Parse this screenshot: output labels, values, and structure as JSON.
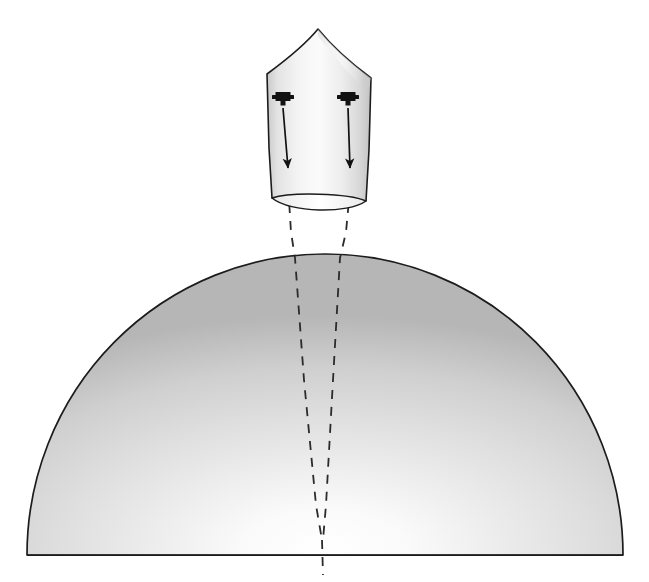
{
  "figure": {
    "domain": "Diagram",
    "title": "",
    "background_color": "#ffffff",
    "width": 649,
    "height": 582,
    "stroke_color": "#1a1a1a",
    "dash_color": "#2b2b2b"
  },
  "spacecraft": {
    "name": "capsule",
    "label": "",
    "body_fill_light": "#fcfcfc",
    "body_fill_mid": "#e8e8e8",
    "body_fill_edge": "#c9c9c9",
    "outline_color": "#1c1c1c",
    "outline_width": 1.6,
    "nose_apex": {
      "x": 318,
      "y": 29
    },
    "shoulder_left": {
      "x": 267,
      "y": 73
    },
    "shoulder_right": {
      "x": 371,
      "y": 77
    },
    "skirt_left": {
      "x": 272,
      "y": 198
    },
    "skirt_right": {
      "x": 366,
      "y": 201
    },
    "base_ellipse": {
      "cx": 319,
      "cy": 203,
      "rx": 47,
      "ry": 8
    }
  },
  "emitters": [
    {
      "name": "emitter-left",
      "label": "",
      "fill": "#111111",
      "x": 283,
      "y": 99,
      "head_width": 15,
      "head_height": 9,
      "stem_width": 5,
      "stem_height": 5
    },
    {
      "name": "emitter-right",
      "label": "",
      "fill": "#111111",
      "x": 348,
      "y": 99,
      "head_width": 15,
      "head_height": 9,
      "stem_width": 5,
      "stem_height": 5
    }
  ],
  "beam_arrows": [
    {
      "name": "beam-arrow-left",
      "label": "",
      "from": {
        "x": 283,
        "y": 108
      },
      "to": {
        "x": 288,
        "y": 168
      },
      "color": "#111111",
      "line_width": 1.7,
      "head_length": 15,
      "head_width": 9
    },
    {
      "name": "beam-arrow-right",
      "label": "",
      "from": {
        "x": 348,
        "y": 108
      },
      "to": {
        "x": 350,
        "y": 168
      },
      "color": "#111111",
      "line_width": 1.7,
      "head_length": 15,
      "head_width": 9
    }
  ],
  "sight_lines": [
    {
      "name": "sight-line-left",
      "label": "",
      "points": [
        {
          "x": 288,
          "y": 170
        },
        {
          "x": 289,
          "y": 200
        },
        {
          "x": 291,
          "y": 232
        },
        {
          "x": 295,
          "y": 258
        },
        {
          "x": 304,
          "y": 380
        },
        {
          "x": 316,
          "y": 505
        },
        {
          "x": 322,
          "y": 540
        }
      ],
      "dash": "9 8",
      "width": 1.8
    },
    {
      "name": "sight-line-right",
      "label": "",
      "points": [
        {
          "x": 350,
          "y": 170
        },
        {
          "x": 349,
          "y": 200
        },
        {
          "x": 346,
          "y": 232
        },
        {
          "x": 340,
          "y": 258
        },
        {
          "x": 333,
          "y": 380
        },
        {
          "x": 326,
          "y": 505
        },
        {
          "x": 323,
          "y": 540
        }
      ],
      "dash": "9 8",
      "width": 1.8
    },
    {
      "name": "sight-line-merged",
      "label": "",
      "points": [
        {
          "x": 322,
          "y": 540
        },
        {
          "x": 323,
          "y": 575
        }
      ],
      "dash": "9 8",
      "width": 1.8
    }
  ],
  "planet_dome": {
    "name": "planet-dome",
    "label": "",
    "center": {
      "x": 325,
      "y": 555
    },
    "radius_x": 298,
    "radius_y": 301,
    "baseline_y": 555,
    "left_x": 27,
    "right_x": 623,
    "top_y": 254,
    "outline_color": "#1c1c1c",
    "outline_width": 1.7,
    "highlight": {
      "x": 325,
      "y": 548
    },
    "fill_center": "#fdfdfd",
    "fill_mid": "#dcdcdc",
    "fill_edge": "#b2b2b2"
  },
  "annotations": {
    "figure_caption": "",
    "axis_labels": [],
    "legend": []
  }
}
